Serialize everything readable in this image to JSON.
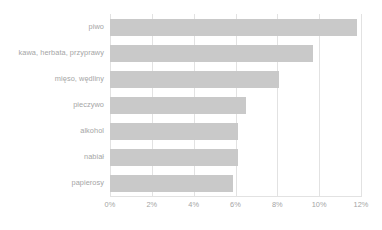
{
  "chart_data": {
    "type": "bar",
    "orientation": "horizontal",
    "title": "",
    "xlabel": "",
    "ylabel": "",
    "categories": [
      "piwo",
      "kawa, herbata, przyprawy",
      "mięso, wędliny",
      "pieczywo",
      "alkohol",
      "nabiał",
      "papierosy"
    ],
    "values": [
      11.8,
      9.7,
      8.1,
      6.5,
      6.1,
      6.1,
      5.9
    ],
    "value_unit": "%",
    "xlim": [
      0,
      12
    ],
    "xticks": [
      0,
      2,
      4,
      6,
      8,
      10,
      12
    ],
    "xtick_labels": [
      "0%",
      "2%",
      "4%",
      "6%",
      "8%",
      "10%",
      "12%"
    ],
    "grid": true,
    "grid_axis": "x",
    "legend": false,
    "series": [
      {
        "name": "",
        "values": [
          11.8,
          9.7,
          8.1,
          6.5,
          6.1,
          6.1,
          5.9
        ]
      }
    ]
  },
  "style": {
    "bar_color": "#c9c9c9",
    "grid_color": "#e2e2e2",
    "text_color": "#a5a5a5",
    "background": "#ffffff"
  }
}
